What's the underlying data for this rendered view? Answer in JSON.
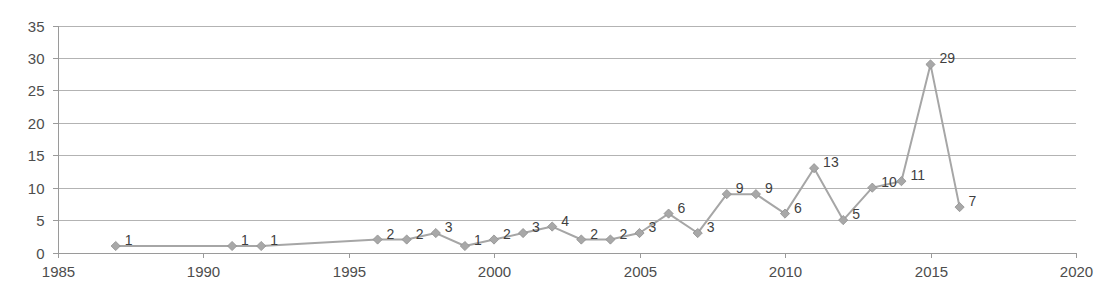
{
  "chart_data": {
    "type": "line",
    "title": "",
    "subtitle": "",
    "xlabel": "",
    "ylabel": "",
    "xlim": [
      1985,
      2020
    ],
    "ylim": [
      0,
      35
    ],
    "grid": true,
    "legend": "none",
    "series_name": "count",
    "marker": "diamond",
    "data_labels": true,
    "x_ticks": [
      "1985",
      "1990",
      "1995",
      "2000",
      "2005",
      "2010",
      "2015",
      "2020"
    ],
    "x_tick_values": [
      1985,
      1990,
      1995,
      2000,
      2005,
      2010,
      2015,
      2020
    ],
    "y_ticks": [
      "0",
      "5",
      "10",
      "15",
      "20",
      "25",
      "30",
      "35"
    ],
    "y_tick_values": [
      0,
      5,
      10,
      15,
      20,
      25,
      30,
      35
    ],
    "x": [
      1987,
      1991,
      1992,
      1996,
      1997,
      1998,
      1999,
      2000,
      2001,
      2002,
      2003,
      2004,
      2005,
      2006,
      2007,
      2008,
      2009,
      2010,
      2011,
      2012,
      2013,
      2014,
      2015,
      2016
    ],
    "values": [
      1,
      1,
      1,
      2,
      2,
      3,
      1,
      2,
      3,
      4,
      2,
      2,
      3,
      6,
      3,
      9,
      9,
      6,
      13,
      5,
      10,
      11,
      29,
      7
    ],
    "point_labels": [
      "1",
      "1",
      "1",
      "2",
      "2",
      "3",
      "1",
      "2",
      "3",
      "4",
      "2",
      "2",
      "3",
      "6",
      "3",
      "9",
      "9",
      "6",
      "13",
      "5",
      "10",
      "11",
      "29",
      "7"
    ],
    "colors": {
      "line": "#a6a6a6",
      "marker": "#a8a8a8",
      "grid": "#b3b3b3",
      "axis": "#9a9a9a",
      "text": "#4d4d4d",
      "background": "#ffffff"
    }
  }
}
